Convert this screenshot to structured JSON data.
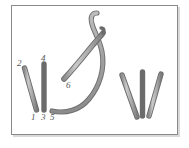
{
  "figure": {
    "background_color": "#ffffff",
    "frame": {
      "border_color": "#8a8a8a",
      "shadow_color": "#d9d9d9",
      "fill_color": "#ffffff"
    },
    "stroke_style": {
      "outline_color": "#6b6b6b",
      "fill_color": "#b4b4b4",
      "highlight_color": "#d8d8d8",
      "thread_color": "#a8a8a8",
      "needle_color": "#9a9a9a"
    },
    "labels": [
      {
        "id": "label-2",
        "text": "2",
        "x": 17,
        "y": 59
      },
      {
        "id": "label-4",
        "text": "4",
        "x": 41,
        "y": 54
      },
      {
        "id": "label-6",
        "text": "6",
        "x": 66,
        "y": 81
      },
      {
        "id": "label-1",
        "text": "1",
        "x": 31,
        "y": 113
      },
      {
        "id": "label-3",
        "text": "3",
        "x": 41,
        "y": 113
      },
      {
        "id": "label-5",
        "text": "5",
        "x": 50,
        "y": 113
      }
    ],
    "left_group": {
      "name": "active-stitch-group",
      "strokes": [
        {
          "id": "stroke-2-1",
          "from": "2",
          "to": "1",
          "x1": 24,
          "y1": 68,
          "x2": 36,
          "y2": 110
        },
        {
          "id": "stroke-4-3",
          "from": "4",
          "to": "3",
          "x1": 44,
          "y1": 64,
          "x2": 44,
          "y2": 110
        }
      ]
    },
    "right_group": {
      "name": "completed-stitch-group",
      "strokes": [
        {
          "id": "stroke-r1",
          "x1": 122,
          "y1": 75,
          "x2": 137,
          "y2": 117
        },
        {
          "id": "stroke-r2",
          "x1": 142,
          "y1": 72,
          "x2": 142,
          "y2": 116
        },
        {
          "id": "stroke-r3",
          "x1": 148,
          "y1": 116,
          "x2": 160,
          "y2": 74
        }
      ]
    },
    "needle": {
      "name": "curved-needle",
      "tip_x": 64,
      "tip_y": 78,
      "eye_x": 101,
      "eye_y": 33
    },
    "thread": {
      "name": "thread-loop",
      "start_x": 53,
      "start_y": 111,
      "end_x": 96,
      "end_y": 14
    }
  }
}
